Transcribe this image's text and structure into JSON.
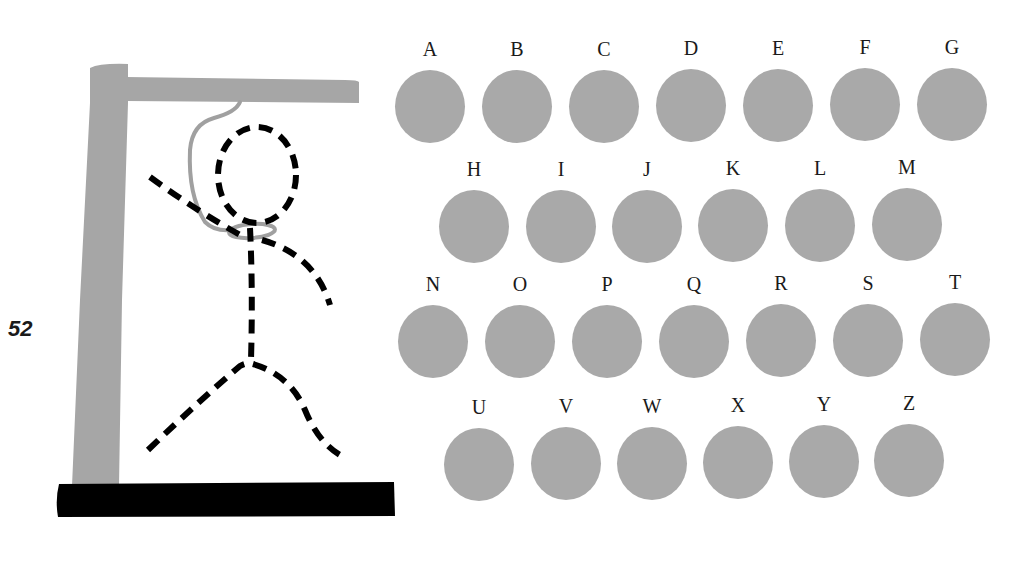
{
  "page": {
    "number": "52"
  },
  "colors": {
    "gallows_gray": "#a6a6a6",
    "rope_gray": "#a0a0a0",
    "base_black": "#000000",
    "circle_gray": "#a9a9a9",
    "figure_black": "#000000"
  },
  "hangman": {
    "parts_drawn": [
      "head",
      "body",
      "left-arm",
      "right-arm",
      "left-leg",
      "right-leg",
      "noose"
    ],
    "style": "dashed"
  },
  "letters": {
    "rows": [
      [
        "A",
        "B",
        "C",
        "D",
        "E",
        "F",
        "G"
      ],
      [
        "H",
        "I",
        "J",
        "K",
        "L",
        "M"
      ],
      [
        "N",
        "O",
        "P",
        "Q",
        "R",
        "S",
        "T"
      ],
      [
        "U",
        "V",
        "W",
        "X",
        "Y",
        "Z"
      ]
    ],
    "r0": {
      "0": "A",
      "1": "B",
      "2": "C",
      "3": "D",
      "4": "E",
      "5": "F",
      "6": "G"
    },
    "r1": {
      "0": "H",
      "1": "I",
      "2": "J",
      "3": "K",
      "4": "L",
      "5": "M"
    },
    "r2": {
      "0": "N",
      "1": "O",
      "2": "P",
      "3": "Q",
      "4": "R",
      "5": "S",
      "6": "T"
    },
    "r3": {
      "0": "U",
      "1": "V",
      "2": "W",
      "3": "X",
      "4": "Y",
      "5": "Z"
    }
  }
}
